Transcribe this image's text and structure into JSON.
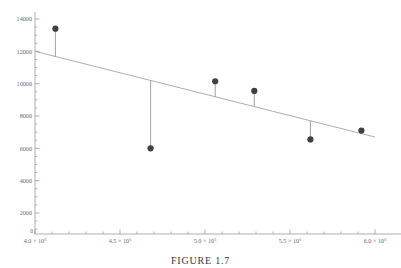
{
  "figure": {
    "caption": "FIGURE 1.7",
    "background": "#ffffff",
    "marker_color": "#404040",
    "line_color": "#9a9a9a",
    "axis_color": "#8c8c8c",
    "label_color": "#6b6b6b"
  },
  "chart_data": {
    "type": "scatter",
    "title": "",
    "subtitle": "",
    "xlabel": "",
    "ylabel": "",
    "grid": false,
    "legend": false,
    "legend_position": "none",
    "xlim": [
      4000000,
      6000000
    ],
    "ylim": [
      0,
      14000
    ],
    "xticks": [
      4000000,
      4500000,
      5000000,
      5500000,
      6000000
    ],
    "xtick_labels": [
      "4.0 × 10⁶",
      "4.5 × 10⁶",
      "5.0 × 10⁶",
      "5.5 × 10⁶",
      "6.0 × 10⁶"
    ],
    "yticks": [
      2000,
      4000,
      6000,
      8000,
      10000,
      12000,
      14000
    ],
    "ytick_labels": [
      "2000",
      "4000",
      "6000",
      "8000",
      "10000",
      "12000",
      "14000"
    ],
    "y_minor_tick_step": 500,
    "x_minor_tick_step": 100000,
    "origin_label": "0",
    "points": [
      {
        "x": 4120000,
        "y": 13400
      },
      {
        "x": 4680000,
        "y": 6000
      },
      {
        "x": 5060000,
        "y": 10150
      },
      {
        "x": 5290000,
        "y": 9550
      },
      {
        "x": 5620000,
        "y": 6550
      },
      {
        "x": 5920000,
        "y": 7100
      }
    ],
    "residual_lines": true,
    "series": [
      {
        "name": "observations",
        "x": [
          4120000,
          4680000,
          5060000,
          5290000,
          5620000,
          5920000
        ],
        "values": [
          13400,
          6000,
          10150,
          9550,
          6550,
          7100
        ]
      },
      {
        "name": "fitted-line",
        "type": "line",
        "x": [
          4000000,
          6000000
        ],
        "values": [
          12000,
          6700
        ]
      }
    ]
  }
}
